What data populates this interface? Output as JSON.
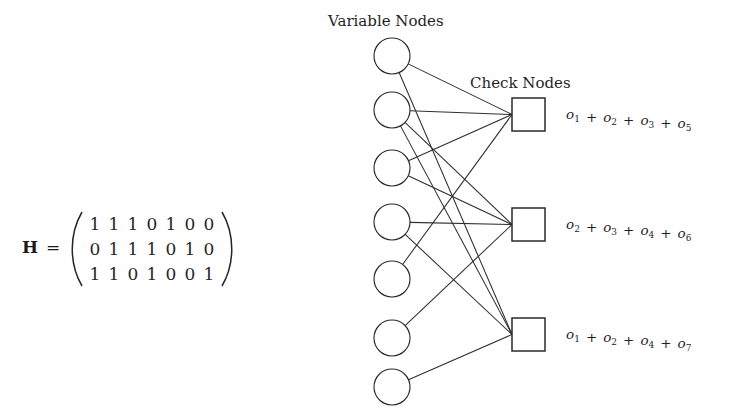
{
  "figure": {
    "background_color": "#ffffff",
    "ink_color": "#222222",
    "variable_nodes_label": "Variable Nodes",
    "check_nodes_label": "Check Nodes"
  },
  "matrix": {
    "name": "H",
    "equals": "=",
    "left_paren": "(",
    "right_paren": ")",
    "rows": [
      [
        "1",
        "1",
        "1",
        "0",
        "1",
        "0",
        "0"
      ],
      [
        "0",
        "1",
        "1",
        "1",
        "0",
        "1",
        "0"
      ],
      [
        "1",
        "1",
        "0",
        "1",
        "0",
        "0",
        "1"
      ]
    ]
  },
  "variable_nodes": [
    {
      "id": "o1",
      "var": "o",
      "sub": "1",
      "cx": 392,
      "cy": 56,
      "r": 18
    },
    {
      "id": "o2",
      "var": "o",
      "sub": "2",
      "cx": 392,
      "cy": 110,
      "r": 18
    },
    {
      "id": "o3",
      "var": "o",
      "sub": "3",
      "cx": 392,
      "cy": 168,
      "r": 18
    },
    {
      "id": "o4",
      "var": "o",
      "sub": "4",
      "cx": 392,
      "cy": 222,
      "r": 18
    },
    {
      "id": "o5",
      "var": "o",
      "sub": "5",
      "cx": 392,
      "cy": 279,
      "r": 18
    },
    {
      "id": "o6",
      "var": "o",
      "sub": "6",
      "cx": 392,
      "cy": 338,
      "r": 18
    },
    {
      "id": "o7",
      "var": "o",
      "sub": "7",
      "cx": 392,
      "cy": 387,
      "r": 18
    }
  ],
  "check_nodes": [
    {
      "id": "c1",
      "x": 512,
      "y": 98,
      "size": 33,
      "connects": [
        "o1",
        "o2",
        "o3",
        "o5"
      ],
      "equation_terms": [
        "o1",
        "o2",
        "o3",
        "o5"
      ],
      "equation_text": "o1 + o2 + o3 + o5",
      "equation_x": 566,
      "equation_y": 119
    },
    {
      "id": "c2",
      "x": 512,
      "y": 208,
      "size": 33,
      "connects": [
        "o2",
        "o3",
        "o4",
        "o6"
      ],
      "equation_terms": [
        "o2",
        "o3",
        "o4",
        "o6"
      ],
      "equation_text": "o2 + o3 + o4 + o6",
      "equation_x": 566,
      "equation_y": 229
    },
    {
      "id": "c3",
      "x": 512,
      "y": 318,
      "size": 33,
      "connects": [
        "o1",
        "o2",
        "o4",
        "o7"
      ],
      "equation_terms": [
        "o1",
        "o2",
        "o4",
        "o7"
      ],
      "equation_text": "o1 + o2 + o4 + o7",
      "equation_x": 566,
      "equation_y": 339
    }
  ],
  "labels": {
    "variable_nodes_x": 328,
    "variable_nodes_y": 26,
    "check_nodes_x": 470,
    "check_nodes_y": 88
  },
  "matrix_layout": {
    "name_x": 22,
    "name_y": 253,
    "equals_x": 46,
    "equals_y": 253,
    "paren_left_x": 76,
    "paren_right_x": 228,
    "paren_y": 253,
    "first_digit_x": 95,
    "digit_step_x": 19,
    "first_row_y": 230,
    "row_step_y": 25
  }
}
